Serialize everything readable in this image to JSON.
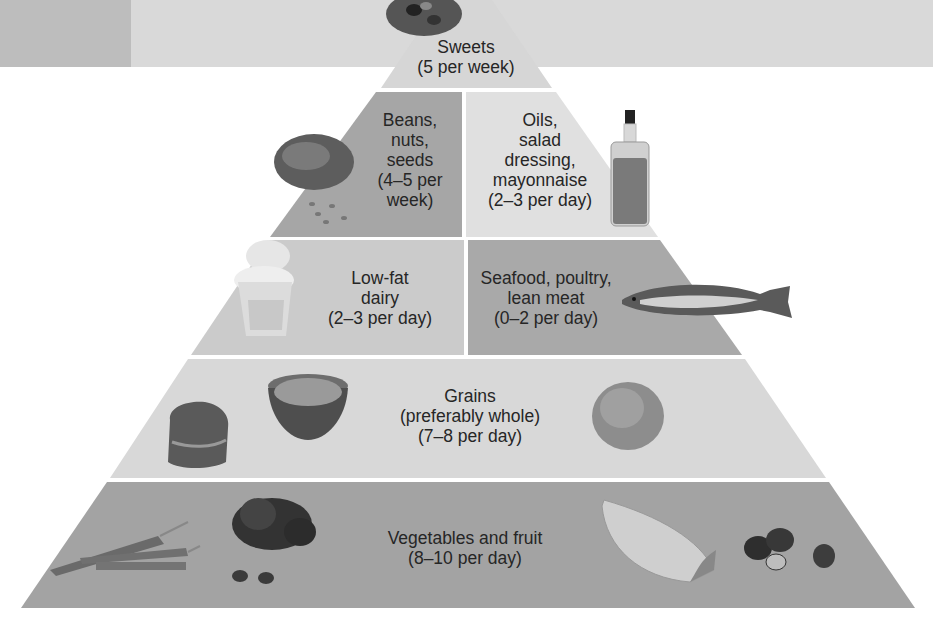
{
  "diagram": {
    "type": "food-pyramid",
    "colors": {
      "header_left": "#bdbdbd",
      "header_right": "#d9d9d9",
      "sweets_tier": "#d6d6d6",
      "beans_tier": "#a6a6a6",
      "oils_tier": "#e0e0e0",
      "dairy_tier": "#cbcbcb",
      "seafood_tier": "#a9a9a9",
      "grains_tier": "#d8d8d8",
      "veg_tier": "#a3a3a3",
      "divider": "#ffffff"
    },
    "tiers": [
      {
        "id": "sweets",
        "lines": [
          "Sweets",
          "(5 per week)"
        ],
        "images": [
          "cookie-icon"
        ]
      },
      {
        "id": "beans",
        "lines": [
          "Beans,",
          "nuts,",
          "seeds",
          "(4–5 per",
          "week)"
        ],
        "images": [
          "seeds-icon"
        ]
      },
      {
        "id": "oils",
        "lines": [
          "Oils,",
          "salad",
          "dressing,",
          "mayonnaise",
          "(2–3 per day)"
        ],
        "images": [
          "oil-bottle-icon"
        ]
      },
      {
        "id": "dairy",
        "lines": [
          "Low-fat",
          "dairy",
          "(2–3 per day)"
        ],
        "images": [
          "yogurt-cup-icon"
        ]
      },
      {
        "id": "seafood",
        "lines": [
          "Seafood, poultry,",
          "lean meat",
          "(0–2 per day)"
        ],
        "images": [
          "fish-icon"
        ]
      },
      {
        "id": "grains",
        "lines": [
          "Grains",
          "(preferably whole)",
          "(7–8 per day)"
        ],
        "images": [
          "bread-icon",
          "cereal-bowl-icon",
          "rice-pile-icon"
        ]
      },
      {
        "id": "vegetables",
        "lines": [
          "Vegetables and fruit",
          "(8–10 per day)"
        ],
        "images": [
          "carrots-icon",
          "spinach-icon",
          "melon-slice-icon",
          "strawberries-icon"
        ]
      }
    ]
  }
}
